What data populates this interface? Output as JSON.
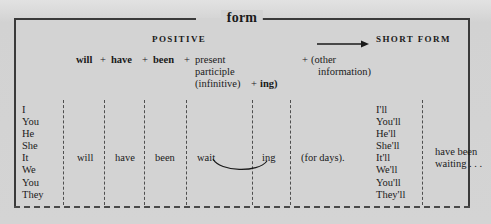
{
  "box": {
    "title": "form",
    "header": {
      "positive": "POSITIVE",
      "short_form": "SHORT FORM",
      "arrow_icon": "right-arrow-icon"
    },
    "formula": {
      "will": "will",
      "plus1": "+",
      "have": "have",
      "plus2": "+",
      "been": "been",
      "plus3": "+",
      "present": "present",
      "participle": "participle",
      "infinitive": "(infinitive)",
      "plus4": "+",
      "ing": "ing)",
      "plus5": "+",
      "other": "(other",
      "information": "information)"
    },
    "columns": {
      "subjects": [
        "I",
        "You",
        "He",
        "She",
        "It",
        "We",
        "You",
        "They"
      ],
      "short_forms": [
        "I'll",
        "You'll",
        "He'll",
        "She'll",
        "It'll",
        "We'll",
        "You'll",
        "They'll"
      ]
    },
    "example": {
      "will": "will",
      "have": "have",
      "been": "been",
      "verb": "wait",
      "suffix": "ing",
      "object": "(for days).",
      "short_example_line1": "have been",
      "short_example_line2": "waiting . . ."
    }
  },
  "colors": {
    "paper": "#d3d3d3",
    "ink": "#1a1a1a",
    "border": "#3a3a3a",
    "dashed": "#4e4e4e"
  }
}
